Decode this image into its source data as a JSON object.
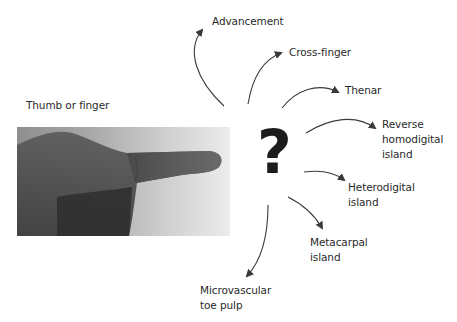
{
  "source": {
    "label": "Thumb or finger",
    "image_alt": "Photo of a hand with index finger extended, fingertip defect"
  },
  "center": {
    "symbol": "?"
  },
  "options": [
    {
      "id": "advancement",
      "lines": [
        "Advancement"
      ]
    },
    {
      "id": "cross-finger",
      "lines": [
        "Cross-finger"
      ]
    },
    {
      "id": "thenar",
      "lines": [
        "Thenar"
      ]
    },
    {
      "id": "reverse-homodigital-island",
      "lines": [
        "Reverse",
        "homodigital",
        "island"
      ]
    },
    {
      "id": "heterodigital-island",
      "lines": [
        "Heterodigital",
        "island"
      ]
    },
    {
      "id": "metacarpal-island",
      "lines": [
        "Metacarpal",
        "island"
      ]
    },
    {
      "id": "microvascular-toe-pulp",
      "lines": [
        "Microvascular",
        "toe pulp"
      ]
    }
  ],
  "colors": {
    "text": "#2a2a2a",
    "arrow": "#3a3a3a",
    "question_mark": "#1c1c1c",
    "background": "#ffffff"
  }
}
